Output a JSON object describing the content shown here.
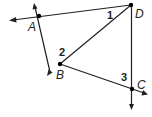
{
  "diagram": {
    "type": "geometry",
    "points": {
      "A": {
        "label": "A",
        "x": 39,
        "y": 16
      },
      "B": {
        "label": "B",
        "x": 60,
        "y": 64
      },
      "C": {
        "label": "C",
        "x": 132,
        "y": 89
      },
      "D": {
        "label": "D",
        "x": 131,
        "y": 5
      }
    },
    "angles": {
      "1": {
        "label": "1",
        "at": "D"
      },
      "2": {
        "label": "2",
        "at": "B"
      },
      "3": {
        "label": "3",
        "at": "C"
      }
    },
    "segments": [
      "DA",
      "AB",
      "BD",
      "BC",
      "DC"
    ],
    "rays": [
      "DA extended past A",
      "BA extended past A",
      "AB extended past B",
      "BC extended past C",
      "DC extended past C"
    ],
    "colors": {
      "line": "#231f20",
      "point": "#000000",
      "background": "#ffffff"
    }
  }
}
